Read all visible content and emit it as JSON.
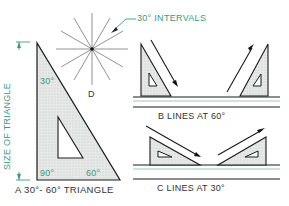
{
  "figure": {
    "d_label": "D",
    "intervals_label": "30° INTERVALS",
    "size_label": "SIZE OF TRIANGLE",
    "angle_30": "30°",
    "angle_90": "90°",
    "angle_60": "60°",
    "a_caption": "A  30°- 60° TRIANGLE",
    "b_caption": "B  LINES AT 60°",
    "c_caption": "C  LINES AT 30°"
  },
  "colors": {
    "line": "#1a1a1a",
    "accent": "#3a9a7a",
    "fill": "#e2e6e4",
    "text": "#333333"
  }
}
